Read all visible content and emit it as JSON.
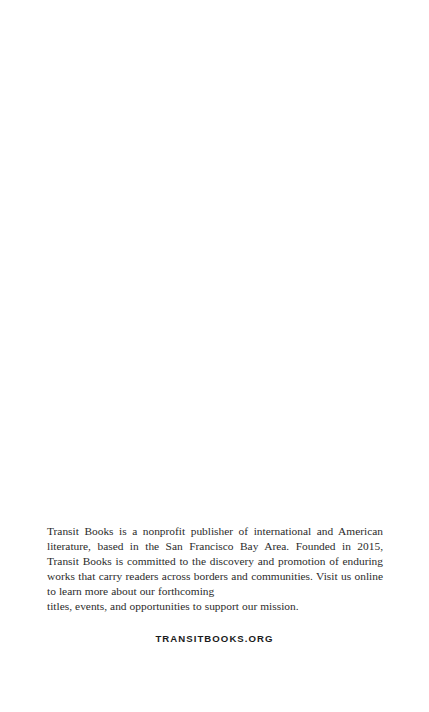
{
  "page": {
    "background_color": "#ffffff",
    "body_text_color": "#2b2b2b",
    "url_text_color": "#1b1b1b",
    "width": 429,
    "height": 712
  },
  "colophon": {
    "paragraph_lines": [
      "Transit Books is a nonprofit publisher of international and American literature,",
      "based in the San Francisco Bay Area. Founded in 2015, Transit Books is commit-",
      "ted to the discovery and promotion of enduring works that carry readers across",
      "borders and communities. Visit us online to learn more about our forthcoming",
      "titles, events, and opportunities to support our mission."
    ],
    "paragraph_justified_part": "Transit Books is a nonprofit publisher of international and American literature, based in the San Francisco Bay Area. Founded in 2015, Transit Books is committed to the discovery and promotion of enduring works that carry readers across borders and communities. Visit us online to learn more about our forthcoming",
    "paragraph_last_line": "titles, events, and opportunities to support our mission.",
    "publisher_name": "Transit Books",
    "founded_year": "2015",
    "location": "San Francisco Bay Area"
  },
  "footer": {
    "url_label": "TRANSITBOOKS.ORG"
  }
}
